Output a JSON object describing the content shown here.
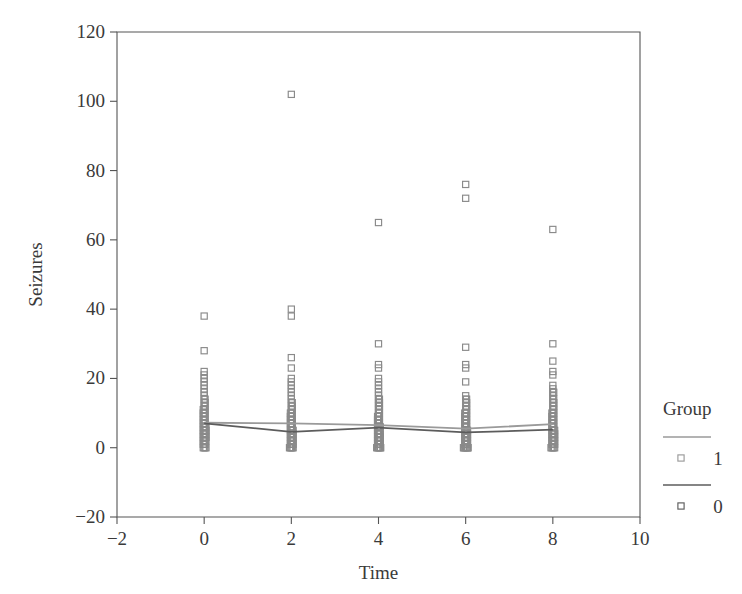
{
  "chart_data": {
    "type": "scatter",
    "title": "",
    "xlabel": "Time",
    "ylabel": "Seizures",
    "xlim": [
      -2,
      10
    ],
    "ylim": [
      -20,
      120
    ],
    "xticks": [
      -2,
      0,
      2,
      4,
      6,
      8,
      10
    ],
    "xtick_labels": [
      "−2",
      "0",
      "2",
      "4",
      "6",
      "8",
      "10"
    ],
    "yticks": [
      -20,
      0,
      20,
      40,
      60,
      80,
      100,
      120
    ],
    "ytick_labels": [
      "−20",
      "0",
      "20",
      "40",
      "60",
      "80",
      "100",
      "120"
    ],
    "grid": false,
    "legend": {
      "title": "Group",
      "position": "right",
      "entries": [
        {
          "label": "1",
          "color": "#9a9a9a",
          "marker": "open-square"
        },
        {
          "label": "0",
          "color": "#5c5c5c",
          "marker": "open-square"
        }
      ]
    },
    "marker_style": "open-square",
    "marker_color": "#8a8a8a",
    "series": [
      {
        "name": "Group 1 mean",
        "type": "line",
        "color": "#9a9a9a",
        "x": [
          0,
          2,
          4,
          6,
          8
        ],
        "values": [
          7.2,
          7.0,
          6.5,
          5.5,
          6.8
        ]
      },
      {
        "name": "Group 0 mean",
        "type": "line",
        "color": "#5c5c5c",
        "x": [
          0,
          2,
          4,
          6,
          8
        ],
        "values": [
          7.0,
          4.6,
          5.8,
          4.4,
          5.2
        ]
      }
    ],
    "points": {
      "x": [
        0,
        2,
        4,
        6,
        8
      ],
      "columns": [
        {
          "x": 0,
          "values": [
            38,
            28,
            22,
            21,
            20,
            19,
            18,
            17,
            16,
            15,
            14,
            14,
            13,
            13,
            12,
            12,
            11,
            11,
            11,
            10,
            10,
            10,
            9,
            9,
            9,
            8,
            8,
            8,
            7,
            7,
            7,
            6,
            6,
            6,
            6,
            5,
            5,
            5,
            5,
            4,
            4,
            4,
            4,
            3,
            3,
            3,
            3,
            2,
            2,
            2,
            2,
            1,
            1,
            1,
            0,
            0,
            0,
            0
          ]
        },
        {
          "x": 2,
          "values": [
            102,
            40,
            38,
            26,
            23,
            20,
            19,
            18,
            17,
            16,
            15,
            14,
            13,
            13,
            12,
            12,
            11,
            11,
            10,
            10,
            10,
            9,
            9,
            9,
            8,
            8,
            8,
            7,
            7,
            7,
            6,
            6,
            6,
            5,
            5,
            5,
            5,
            4,
            4,
            4,
            4,
            3,
            3,
            3,
            3,
            2,
            2,
            2,
            2,
            1,
            1,
            1,
            1,
            0,
            0,
            0,
            0,
            0
          ]
        },
        {
          "x": 4,
          "values": [
            65,
            30,
            24,
            23,
            20,
            19,
            18,
            17,
            16,
            15,
            14,
            14,
            13,
            13,
            12,
            12,
            11,
            11,
            10,
            10,
            9,
            9,
            9,
            8,
            8,
            8,
            7,
            7,
            7,
            6,
            6,
            6,
            6,
            5,
            5,
            5,
            4,
            4,
            4,
            4,
            3,
            3,
            3,
            3,
            2,
            2,
            2,
            2,
            1,
            1,
            1,
            1,
            0,
            0,
            0,
            0,
            0,
            0
          ]
        },
        {
          "x": 6,
          "values": [
            76,
            72,
            29,
            24,
            23,
            19,
            15,
            14,
            14,
            13,
            13,
            12,
            12,
            11,
            11,
            10,
            10,
            10,
            9,
            9,
            9,
            8,
            8,
            8,
            7,
            7,
            7,
            6,
            6,
            6,
            5,
            5,
            5,
            5,
            4,
            4,
            4,
            4,
            3,
            3,
            3,
            3,
            2,
            2,
            2,
            2,
            1,
            1,
            1,
            1,
            0,
            0,
            0,
            0,
            0,
            0,
            0,
            0
          ]
        },
        {
          "x": 8,
          "values": [
            63,
            30,
            25,
            22,
            21,
            18,
            17,
            16,
            16,
            15,
            14,
            14,
            13,
            13,
            12,
            12,
            11,
            11,
            10,
            10,
            10,
            9,
            9,
            9,
            8,
            8,
            8,
            7,
            7,
            7,
            6,
            6,
            6,
            5,
            5,
            5,
            5,
            4,
            4,
            4,
            4,
            3,
            3,
            3,
            3,
            2,
            2,
            2,
            2,
            1,
            1,
            1,
            1,
            0,
            0,
            0,
            0,
            0
          ]
        }
      ]
    }
  },
  "plot_geometry": {
    "left_px": 117,
    "right_px": 640,
    "top_px": 32,
    "bottom_px": 517
  }
}
